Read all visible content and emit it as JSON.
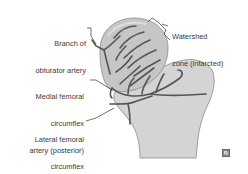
{
  "diagram": {
    "labels": {
      "obturator": {
        "line1": "Branch of",
        "line2": "obturator artery"
      },
      "watershed": {
        "line1": "Watershed",
        "line2": "zone (infarcted)"
      },
      "medial": {
        "line1": "Medial femoral",
        "line2": "circumflex",
        "line3": "artery (posterior)"
      },
      "lateral": {
        "line1": "Lateral femoral",
        "line2": "circumflex",
        "line3": "artery (anterior)"
      }
    },
    "colors": {
      "bone_fill": "#d4d4d4",
      "head_fill": "#c6c6c6",
      "bone_outline": "#8c8c8c",
      "vessel": "#555555",
      "leader_line": "#333333",
      "text": "#3a3a3a"
    },
    "corner_icon": "image-expand-icon"
  }
}
